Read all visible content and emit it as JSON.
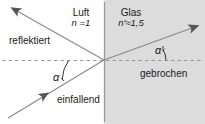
{
  "diagram": {
    "canvas": {
      "width": 205,
      "height": 124
    },
    "colors": {
      "background": "#ffffff",
      "glass_fill": "#dcdcdc",
      "ray": "#8a8a8a",
      "arrowhead": "#555555",
      "interface_line": "#9a9a9a",
      "normal_dashed": "#9a9a9a",
      "text": "#1a1a1a",
      "angle_arc": "#333333"
    },
    "media": {
      "left": {
        "name": "Luft",
        "index_symbol": "n",
        "index_value": "=1",
        "index_text": "n =1"
      },
      "right": {
        "name": "Glas",
        "index_symbol": "n'",
        "index_value": "≈1,5",
        "index_text": "n'≈1,5"
      }
    },
    "rays": [
      {
        "id": "incident",
        "label": "einfallend",
        "direction": "up-right"
      },
      {
        "id": "reflected",
        "label": "reflektiert",
        "direction": "up-left"
      },
      {
        "id": "refracted",
        "label": "gebrochen",
        "direction": "up-right"
      }
    ],
    "angles": [
      {
        "id": "alpha",
        "label": "α",
        "medium": "Luft"
      },
      {
        "id": "alpha-prime",
        "label": "α′",
        "medium": "Glas"
      }
    ],
    "lines": {
      "interface_label": "Grenzflaeche",
      "normal_label": "Lot"
    }
  }
}
